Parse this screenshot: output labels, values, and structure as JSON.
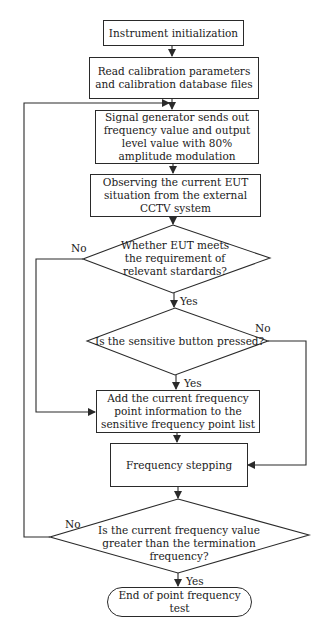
{
  "flowchart": {
    "nodes": {
      "init": "Instrument initialization",
      "read_calibration": "Read calibration parameters and calibration database files",
      "signal_generator": "Signal generator sends out frequency value and output level value with 80% amplitude modulation",
      "observe_eut": "Observing the current EUT situation from the external CCTV system",
      "decision_eut": "Whether EUT meets the requirement of relevant stardards?",
      "decision_button": "Is the sensitive button pressed?",
      "add_point": "Add the current frequency point information to the sensitive frequency point list",
      "freq_step": "Frequency stepping",
      "decision_termination": "Is the current frequency value greater than the termination frequency?",
      "end": "End of point frequency test"
    },
    "labels": {
      "eut_no": "No",
      "eut_yes": "Yes",
      "button_no": "No",
      "button_yes": "Yes",
      "term_no": "No",
      "term_yes": "Yes"
    },
    "colors": {
      "line": "#2a2a2a",
      "background": "#ffffff"
    }
  }
}
